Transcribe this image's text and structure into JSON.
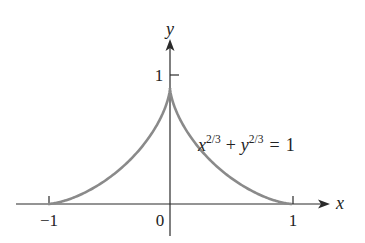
{
  "figure": {
    "equation": {
      "x_var": "x",
      "x_exp": "2/3",
      "plus": "+",
      "y_var": "y",
      "y_exp": "2/3",
      "equals": "=",
      "rhs": "1"
    },
    "axes": {
      "x_label": "x",
      "y_label": "y",
      "x_ticks": [
        {
          "value": -1,
          "label": "−1"
        },
        {
          "value": 0,
          "label": "0"
        },
        {
          "value": 1,
          "label": "1"
        }
      ],
      "y_ticks": [
        {
          "value": 1,
          "label": "1"
        }
      ]
    },
    "colors": {
      "curve": "#8a8a8a",
      "axes": "#2a2a2a",
      "text": "#222222"
    }
  },
  "chart_data": {
    "type": "line",
    "title": "",
    "equation": "x^(2/3) + y^(2/3) = 1",
    "xlabel": "x",
    "ylabel": "y",
    "xlim": [
      -1.1,
      1.2
    ],
    "ylim": [
      -0.25,
      1.3
    ],
    "grid": false,
    "legend": "none",
    "annotations": [
      "x^{2/3} + y^{2/3} = 1"
    ],
    "series": [
      {
        "name": "x^(2/3) + y^(2/3) = 1 (upper half)",
        "x": [
          -1,
          -0.9,
          -0.8,
          -0.7,
          -0.6,
          -0.5,
          -0.4,
          -0.3,
          -0.2,
          -0.1,
          0,
          0.1,
          0.2,
          0.3,
          0.4,
          0.5,
          0.6,
          0.7,
          0.8,
          0.9,
          1
        ],
        "y": [
          0,
          0.002,
          0.013,
          0.038,
          0.079,
          0.137,
          0.217,
          0.321,
          0.456,
          0.635,
          1,
          0.635,
          0.456,
          0.321,
          0.217,
          0.137,
          0.079,
          0.038,
          0.013,
          0.002,
          0
        ]
      }
    ]
  }
}
